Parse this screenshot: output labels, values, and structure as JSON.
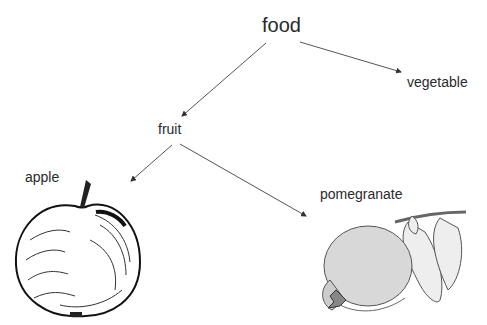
{
  "diagram": {
    "type": "hierarchy-tree",
    "nodes": {
      "root": "food",
      "vegetable": "vegetable",
      "fruit": "fruit",
      "apple": "apple",
      "pomegranate": "pomegranate"
    },
    "edges": [
      {
        "from": "food",
        "to": "fruit"
      },
      {
        "from": "food",
        "to": "vegetable"
      },
      {
        "from": "fruit",
        "to": "apple"
      },
      {
        "from": "fruit",
        "to": "pomegranate"
      }
    ],
    "illustrations": [
      "apple-drawing",
      "pomegranate-drawing"
    ]
  }
}
